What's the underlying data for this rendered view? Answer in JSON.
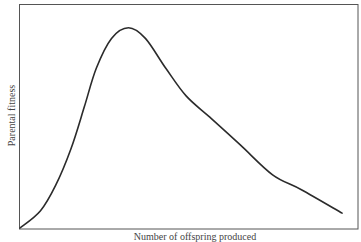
{
  "chart_data": {
    "type": "line",
    "title": "",
    "xlabel": "Number of offspring produced",
    "ylabel": "Parental fitness",
    "grid": false,
    "legend": null,
    "xlim": [
      0,
      1
    ],
    "ylim": [
      0,
      1
    ],
    "x_ticks": [],
    "y_ticks": [],
    "series": [
      {
        "name": "Parental fitness",
        "x": [
          0.0,
          0.06,
          0.105,
          0.15,
          0.19,
          0.225,
          0.27,
          0.32,
          0.37,
          0.43,
          0.49,
          0.56,
          0.65,
          0.745,
          0.83,
          0.95
        ],
        "y": [
          0.0,
          0.08,
          0.2,
          0.37,
          0.57,
          0.75,
          0.89,
          0.94,
          0.89,
          0.75,
          0.62,
          0.52,
          0.39,
          0.25,
          0.18,
          0.07
        ]
      }
    ],
    "frame": {
      "left": 19,
      "top": 4,
      "right": 358,
      "bottom": 229
    },
    "line_color": "#2b2b2b"
  }
}
